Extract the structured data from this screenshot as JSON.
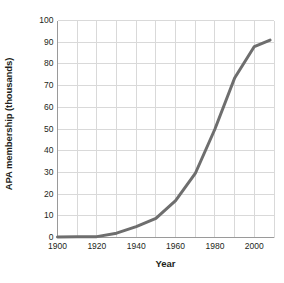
{
  "chart_data": {
    "type": "line",
    "title": "",
    "xlabel": "Year",
    "ylabel": "APA membership (thousands)",
    "xlim": [
      1900,
      2010
    ],
    "ylim": [
      0,
      100
    ],
    "grid": true,
    "legend": false,
    "x_tick_labels": [
      "1900",
      "1920",
      "1940",
      "1960",
      "1980",
      "2000"
    ],
    "x_tick_values": [
      1900,
      1920,
      1940,
      1960,
      1980,
      2000
    ],
    "y_tick_labels": [
      "0",
      "10",
      "20",
      "30",
      "40",
      "50",
      "60",
      "70",
      "80",
      "90",
      "100"
    ],
    "y_tick_values": [
      0,
      10,
      20,
      30,
      40,
      50,
      60,
      70,
      80,
      90,
      100
    ],
    "x_gridline_step": 10,
    "y_gridline_step": 10,
    "series": [
      {
        "name": "APA membership",
        "color": "#6e6e6e",
        "line_width": 3,
        "x": [
          1900,
          1910,
          1920,
          1930,
          1940,
          1950,
          1960,
          1970,
          1980,
          1990,
          2000,
          2008
        ],
        "values": [
          0.2,
          0.3,
          0.4,
          2.0,
          5.0,
          8.8,
          17.0,
          29.5,
          50.0,
          73.5,
          88.0,
          91.0
        ]
      }
    ]
  },
  "axes": {
    "y_axis_title": "APA membership (thousands)",
    "x_axis_title": "Year"
  },
  "colors": {
    "line": "#6e6e6e",
    "grid": "#d9d9d9",
    "axis": "#9a9a9a",
    "text": "#231f20",
    "background": "#ffffff"
  }
}
